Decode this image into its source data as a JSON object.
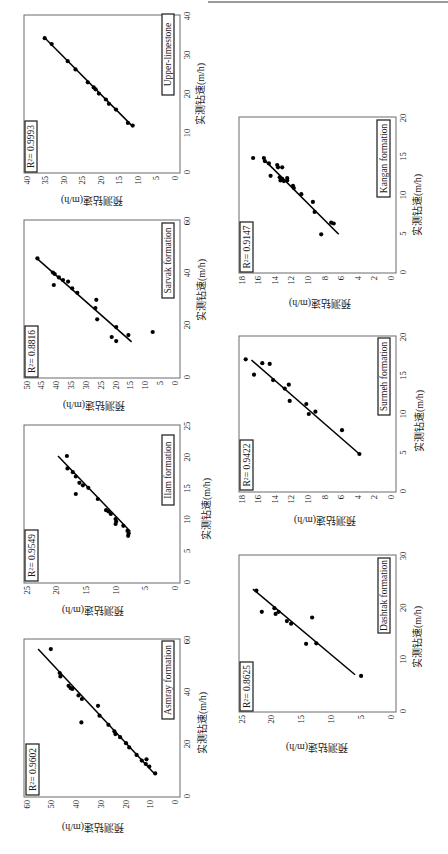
{
  "figure": {
    "rotation_deg": 90,
    "panel_count": 7
  },
  "chart_data": [
    {
      "type": "scatter",
      "title": "Upper-limestone",
      "r2": 0.9993,
      "r2_label": "R²= 0.9993",
      "xlabel": "实测钻速(m/h)",
      "ylabel": "预测钻速(m/h)",
      "xlim": [
        0,
        40
      ],
      "ylim": [
        0,
        40
      ],
      "xticks": [
        0,
        10,
        20,
        30,
        40
      ],
      "yticks": [
        0,
        5,
        10,
        15,
        20,
        25,
        30,
        35,
        40
      ],
      "grid": false,
      "points": [
        [
          34.3,
          35.1
        ],
        [
          32.8,
          33.2
        ],
        [
          28.4,
          28.9
        ],
        [
          26.3,
          26.8
        ],
        [
          23.0,
          23.5
        ],
        [
          21.7,
          21.9
        ],
        [
          21.2,
          21.4
        ],
        [
          20.1,
          20.5
        ],
        [
          18.6,
          18.6
        ],
        [
          17.5,
          17.8
        ],
        [
          16.0,
          15.9
        ],
        [
          12.6,
          12.7
        ],
        [
          11.9,
          11.4
        ]
      ],
      "fit_line": [
        [
          11.9,
          11.6
        ],
        [
          34.3,
          35.0
        ]
      ]
    },
    {
      "type": "scatter",
      "title": "Sarvak formation",
      "r2": 0.8816,
      "r2_label": "R²= 0.8816",
      "xlabel": "实测钻速(m/h)",
      "ylabel": "预测钻速(m/h)",
      "xlim": [
        0,
        60
      ],
      "ylim": [
        0,
        50
      ],
      "xticks": [
        0,
        20,
        40,
        60
      ],
      "yticks": [
        0,
        5,
        10,
        15,
        20,
        25,
        30,
        35,
        40,
        45,
        50
      ],
      "grid": false,
      "points": [
        [
          45.6,
          46.3
        ],
        [
          40.2,
          41.1
        ],
        [
          39.6,
          40.5
        ],
        [
          35.4,
          40.8
        ],
        [
          38.3,
          39.1
        ],
        [
          37.3,
          37.7
        ],
        [
          36.7,
          36.0
        ],
        [
          34.1,
          34.6
        ],
        [
          32.4,
          32.9
        ],
        [
          29.7,
          26.5
        ],
        [
          26.5,
          26.8
        ],
        [
          22.2,
          26.2
        ],
        [
          19.2,
          19.8
        ],
        [
          15.4,
          21.3
        ],
        [
          13.8,
          19.8
        ],
        [
          16.1,
          15.7
        ],
        [
          17.3,
          7.5
        ]
      ],
      "fit_line": [
        [
          13.5,
          14.6
        ],
        [
          46.0,
          46.9
        ]
      ]
    },
    {
      "type": "scatter",
      "title": "Ilam formation",
      "r2": 0.9549,
      "r2_label": "R²= 0.9549",
      "xlabel": "实测钻速(m/h)",
      "ylabel": "预测钻速(m/h)",
      "xlim": [
        0,
        25
      ],
      "ylim": [
        0,
        25
      ],
      "xticks": [
        0,
        5,
        10,
        15,
        20,
        25
      ],
      "yticks": [
        0,
        5,
        10,
        15,
        20,
        25
      ],
      "grid": false,
      "points": [
        [
          20.2,
          18.2
        ],
        [
          18.2,
          18.1
        ],
        [
          17.6,
          17.2
        ],
        [
          16.9,
          16.7
        ],
        [
          15.9,
          16.1
        ],
        [
          15.5,
          15.5
        ],
        [
          14.1,
          16.7
        ],
        [
          15.1,
          14.6
        ],
        [
          13.3,
          13.0
        ],
        [
          11.5,
          11.6
        ],
        [
          11.3,
          11.2
        ],
        [
          10.9,
          10.8
        ],
        [
          10.1,
          10.0
        ],
        [
          9.7,
          9.9
        ],
        [
          9.3,
          10.0
        ],
        [
          9.0,
          8.7
        ],
        [
          8.2,
          8.0
        ],
        [
          7.8,
          7.8
        ],
        [
          7.4,
          7.9
        ]
      ],
      "fit_line": [
        [
          8.1,
          7.5
        ],
        [
          20.2,
          19.7
        ]
      ]
    },
    {
      "type": "scatter",
      "title": "Asmray formation",
      "r2": 0.9602,
      "r2_label": "R²= 0.9602",
      "xlabel": "实测钻速(m/h)",
      "ylabel": "预测钻速(m/h)",
      "xlim": [
        0,
        60
      ],
      "ylim": [
        0,
        60
      ],
      "xticks": [
        0,
        20,
        40,
        60
      ],
      "yticks": [
        0,
        10,
        20,
        30,
        40,
        50,
        60
      ],
      "grid": false,
      "points": [
        [
          56.5,
          50.2
        ],
        [
          47.3,
          46.6
        ],
        [
          46.0,
          46.3
        ],
        [
          42.4,
          43.0
        ],
        [
          41.5,
          42.2
        ],
        [
          41.2,
          41.5
        ],
        [
          38.7,
          39.0
        ],
        [
          37.3,
          37.6
        ],
        [
          34.7,
          31.1
        ],
        [
          28.3,
          37.8
        ],
        [
          30.9,
          30.5
        ],
        [
          27.4,
          26.9
        ],
        [
          24.9,
          24.5
        ],
        [
          23.8,
          24.1
        ],
        [
          22.6,
          22.2
        ],
        [
          20.3,
          19.8
        ],
        [
          18.7,
          18.5
        ],
        [
          15.8,
          15.5
        ],
        [
          13.6,
          13.4
        ],
        [
          14.1,
          11.5
        ],
        [
          12.3,
          11.8
        ],
        [
          11.3,
          10.4
        ],
        [
          8.7,
          8.0
        ]
      ],
      "fit_line": [
        [
          8.7,
          8.4
        ],
        [
          56.5,
          55.3
        ]
      ]
    },
    {
      "type": "scatter",
      "title": "Kangan formation",
      "r2": 0.9147,
      "r2_label": "R²= 0.9147",
      "xlabel": "实测钻速(m/h)",
      "ylabel": "预测钻速(m/h)",
      "xlim": [
        0,
        20
      ],
      "ylim": [
        0,
        18
      ],
      "xticks": [
        0,
        5,
        10,
        15,
        20
      ],
      "yticks": [
        0,
        2,
        4,
        6,
        8,
        10,
        12,
        14,
        16,
        18
      ],
      "grid": false,
      "points": [
        [
          14.8,
          16.6
        ],
        [
          14.8,
          15.3
        ],
        [
          14.4,
          15.2
        ],
        [
          14.1,
          14.7
        ],
        [
          13.9,
          13.7
        ],
        [
          13.6,
          13.1
        ],
        [
          13.6,
          13.6
        ],
        [
          12.5,
          14.5
        ],
        [
          12.3,
          13.4
        ],
        [
          12.1,
          13.1
        ],
        [
          12.2,
          12.5
        ],
        [
          11.9,
          13.3
        ],
        [
          11.8,
          12.9
        ],
        [
          11.9,
          12.5
        ],
        [
          11.2,
          11.8
        ],
        [
          10.9,
          11.7
        ],
        [
          10.1,
          10.8
        ],
        [
          9.1,
          9.4
        ],
        [
          7.8,
          9.2
        ],
        [
          6.4,
          7.2
        ],
        [
          6.3,
          6.9
        ],
        [
          4.9,
          8.4
        ]
      ],
      "fit_line": [
        [
          4.9,
          6.3
        ],
        [
          14.5,
          15.2
        ]
      ]
    },
    {
      "type": "scatter",
      "title": "Surmeh formation",
      "r2": 0.9422,
      "r2_label": "R²= 0.9422",
      "xlabel": "实测钻速(m/h)",
      "ylabel": "预测钻速(m/h)",
      "xlim": [
        0,
        20
      ],
      "ylim": [
        0,
        18
      ],
      "xticks": [
        0,
        5,
        10,
        15,
        20
      ],
      "yticks": [
        0,
        2,
        4,
        6,
        8,
        10,
        12,
        14,
        16,
        18
      ],
      "grid": false,
      "points": [
        [
          17.1,
          17.5
        ],
        [
          15.1,
          16.5
        ],
        [
          16.6,
          15.5
        ],
        [
          16.5,
          14.6
        ],
        [
          14.4,
          14.2
        ],
        [
          13.3,
          12.8
        ],
        [
          13.8,
          12.3
        ],
        [
          11.7,
          12.2
        ],
        [
          11.3,
          10.2
        ],
        [
          10.0,
          9.9
        ],
        [
          10.3,
          9.1
        ],
        [
          7.9,
          5.9
        ],
        [
          4.8,
          3.8
        ]
      ],
      "fit_line": [
        [
          4.8,
          3.8
        ],
        [
          17.0,
          16.8
        ]
      ]
    },
    {
      "type": "scatter",
      "title": "Dashtak formation",
      "r2": 0.8625,
      "r2_label": "R²= 0.8625",
      "xlabel": "实测钻速(m/h)",
      "ylabel": "预测钻速(m/h)",
      "xlim": [
        0,
        30
      ],
      "ylim": [
        0,
        25
      ],
      "xticks": [
        0,
        10,
        20,
        30
      ],
      "yticks": [
        0,
        5,
        10,
        15,
        20,
        25
      ],
      "grid": false,
      "points": [
        [
          23.3,
          22.5
        ],
        [
          19.2,
          21.6
        ],
        [
          19.9,
          19.5
        ],
        [
          18.8,
          19.3
        ],
        [
          19.2,
          18.8
        ],
        [
          17.4,
          17.4
        ],
        [
          16.9,
          16.7
        ],
        [
          18.1,
          13.2
        ],
        [
          13.0,
          14.2
        ],
        [
          13.1,
          12.5
        ],
        [
          6.8,
          5.0
        ]
      ],
      "fit_line": [
        [
          7.0,
          6.0
        ],
        [
          23.6,
          23.1
        ]
      ]
    }
  ]
}
